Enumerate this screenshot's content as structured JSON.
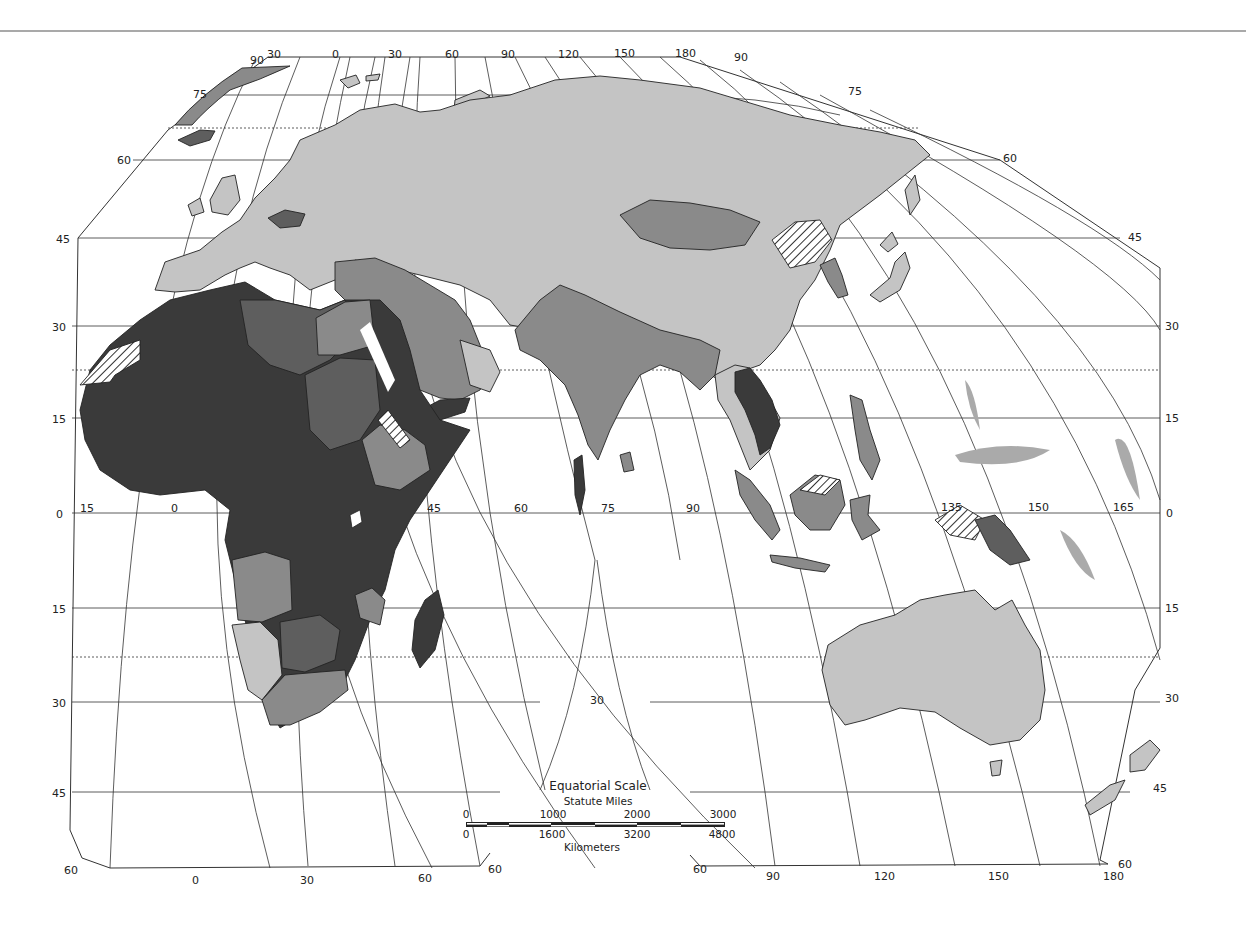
{
  "colors": {
    "background": "#ffffff",
    "light_gray": "#c4c4c4",
    "medium_gray": "#8a8a8a",
    "dark_gray": "#5e5e5e",
    "darkest": "#3a3a3a",
    "outline": "#222222",
    "top_rule": "#555555"
  },
  "latitude_labels_left": [
    "75",
    "60",
    "45",
    "30",
    "15",
    "0",
    "15",
    "30",
    "45",
    "60"
  ],
  "latitude_labels_right": [
    "75",
    "60",
    "45",
    "30",
    "15",
    "0",
    "15",
    "30",
    "45",
    "60"
  ],
  "longitude_labels_top": [
    "90",
    "30",
    "0",
    "30",
    "60",
    "90",
    "120",
    "150",
    "180",
    "90"
  ],
  "longitude_labels_equator": [
    "15",
    "0",
    "45",
    "60",
    "75",
    "90",
    "135",
    "150",
    "165"
  ],
  "longitude_labels_bottom_left": [
    "60",
    "0",
    "30",
    "60",
    "60"
  ],
  "longitude_labels_bottom_right": [
    "60",
    "90",
    "120",
    "150",
    "180",
    "60"
  ],
  "center_meridian_label": "30",
  "scale": {
    "title": "Equatorial Scale",
    "miles_label": "Statute Miles",
    "miles_ticks": [
      "0",
      "1000",
      "2000",
      "3000"
    ],
    "km_ticks": [
      "0",
      "1600",
      "3200",
      "4800"
    ],
    "km_label": "Kilometers"
  }
}
